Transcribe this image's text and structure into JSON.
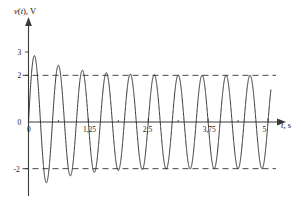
{
  "chart_data": {
    "type": "line",
    "title": "",
    "subtitle": "",
    "xlabel": "t, s",
    "ylabel": "v(t), V",
    "xlabel_parts": {
      "variable": "t",
      "separator": ", ",
      "unit": "s"
    },
    "ylabel_parts": {
      "function": "v",
      "argument": "t",
      "separator": ", ",
      "unit": "V"
    },
    "xlim": [
      0,
      5.15
    ],
    "ylim": [
      -2.75,
      3.35
    ],
    "grid": false,
    "legend": null,
    "x_ticks": [
      0,
      1.25,
      2.5,
      3.75,
      5
    ],
    "x_tick_labels": [
      "0",
      "1,25",
      "2,5",
      "3,75",
      "5"
    ],
    "x_minor_ticks": [
      0.625,
      1.875,
      3.125,
      4.375
    ],
    "y_ticks": [
      3,
      2,
      0,
      -2
    ],
    "y_tick_labels": [
      "3",
      "2",
      "0",
      "-2"
    ],
    "reference_lines": [
      {
        "value": 2,
        "style": "dashed",
        "label": "2"
      },
      {
        "value": -2,
        "style": "dashed",
        "label": "-2"
      }
    ],
    "waveform": {
      "description": "damped sinusoid with decaying envelope settling to amplitude 2",
      "offset": 0,
      "steady_amplitude": 2,
      "initial_amplitude": 3,
      "decay_constant": 1.35,
      "period": 0.5,
      "frequency_hz": 2,
      "phase": 0,
      "cycles_visible": 10,
      "first_peak_value": 3,
      "first_peak_time": 0.125,
      "peak_values": [
        3.0,
        2.52,
        2.27,
        2.14,
        2.07,
        2.04,
        2.02,
        2.01,
        2.0,
        2.0
      ],
      "trough_values": [
        -2.63,
        -2.33,
        -2.17,
        -2.09,
        -2.05,
        -2.03,
        -2.01,
        -2.01,
        -2.0,
        -2.0
      ],
      "start_value": 0
    },
    "series": [
      {
        "name": "v(t)",
        "color": "#2b2b2b",
        "line_style": "solid"
      }
    ],
    "colors": {
      "curve": "#2b2b2b",
      "axis": "#3a3a3a",
      "reference": "#333333",
      "text": "#1a1a1a",
      "background": "#ffffff"
    }
  }
}
